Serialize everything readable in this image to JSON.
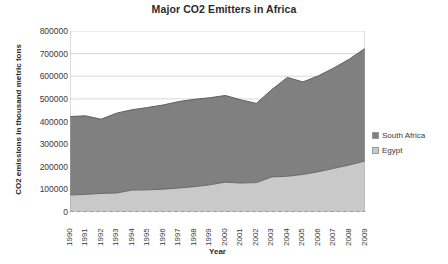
{
  "chart_data": {
    "type": "area",
    "stacked": true,
    "title": "Major CO2 Emitters in Africa",
    "xlabel": "Year",
    "ylabel": "CO2 emissions in thousand metric tons",
    "categories": [
      "1990",
      "1991",
      "1992",
      "1993",
      "1994",
      "1995",
      "1996",
      "1997",
      "1998",
      "1999",
      "2000",
      "2001",
      "2002",
      "2003",
      "2004",
      "2005",
      "2006",
      "2007",
      "2008",
      "2009"
    ],
    "ylim": [
      0,
      800000
    ],
    "ytick_step": 100000,
    "yticks": [
      "800000",
      "700000",
      "600000",
      "500000",
      "400000",
      "300000",
      "200000",
      "100000",
      "0"
    ],
    "grid": true,
    "legend_position": "right",
    "series": [
      {
        "name": "Egypt",
        "color": "#c9c9c9",
        "values": [
          75000,
          78000,
          82000,
          84000,
          97000,
          98000,
          101000,
          106000,
          112000,
          120000,
          132000,
          128000,
          130000,
          155000,
          158000,
          166000,
          178000,
          193000,
          208000,
          225000
        ]
      },
      {
        "name": "South Africa",
        "color": "#808080",
        "values": [
          347000,
          347000,
          328000,
          353000,
          355000,
          364000,
          372000,
          382000,
          386000,
          385000,
          383000,
          368000,
          350000,
          386000,
          437000,
          409000,
          424000,
          444000,
          468000,
          498000
        ]
      }
    ],
    "totals": [
      422000,
      425000,
      410000,
      437000,
      452000,
      462000,
      473000,
      488000,
      498000,
      505000,
      515000,
      496000,
      480000,
      541000,
      595000,
      575000,
      602000,
      637000,
      676000,
      723000
    ]
  },
  "legend": {
    "items": [
      {
        "label": "South Africa",
        "color": "#808080"
      },
      {
        "label": "Egypt",
        "color": "#c9c9c9"
      }
    ]
  }
}
